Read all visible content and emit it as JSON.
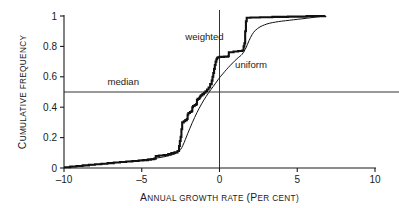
{
  "chart_data": {
    "type": "line",
    "title": "",
    "subtitle": "",
    "xlabel_lead": "A",
    "xlabel_rest": "NNUAL GROWTH RATE",
    "xlabel_paren_lead": "(P",
    "xlabel_paren_rest": "ER CENT)",
    "xlabel_full": "ANNUAL GROWTH RATE (PER CENT)",
    "ylabel_lead": "C",
    "ylabel_rest": "UMULATIVE FREQUENCY",
    "ylabel_full": "CUMULATIVE FREQUENCY",
    "xlim": [
      -10,
      10
    ],
    "ylim": [
      0,
      1
    ],
    "xticks": [
      -10,
      -5,
      0,
      5,
      10
    ],
    "xtick_labels": [
      "–10",
      "–5",
      "0",
      "5",
      "10"
    ],
    "yticks": [
      0,
      0.2,
      0.4,
      0.6,
      0.8,
      1
    ],
    "ytick_labels": [
      "0",
      "0.2",
      "0.4",
      "0.6",
      "0.8",
      "1"
    ],
    "grid": false,
    "legend_position": "inline-annotations",
    "annotations": [
      {
        "name": "median",
        "text": "median",
        "x": -7.2,
        "y": 0.545
      },
      {
        "name": "weighted",
        "text": "weighted",
        "x": -2.2,
        "y": 0.845
      },
      {
        "name": "uniform",
        "text": "uniform",
        "x": 1.0,
        "y": 0.655
      }
    ],
    "reference_lines": [
      {
        "name": "median-line",
        "orientation": "horizontal",
        "value": 0.5,
        "color": "#333333"
      },
      {
        "name": "zero-line",
        "orientation": "vertical",
        "value": 0,
        "color": "#333333"
      }
    ],
    "series": [
      {
        "name": "weighted",
        "style": "step",
        "width": 2.1,
        "color": "#111111",
        "points": [
          [
            -10.0,
            0.005
          ],
          [
            -9.6,
            0.01
          ],
          [
            -9.2,
            0.013
          ],
          [
            -8.8,
            0.017
          ],
          [
            -8.4,
            0.021
          ],
          [
            -8.0,
            0.025
          ],
          [
            -7.6,
            0.028
          ],
          [
            -7.2,
            0.032
          ],
          [
            -6.8,
            0.036
          ],
          [
            -6.4,
            0.039
          ],
          [
            -6.0,
            0.043
          ],
          [
            -5.6,
            0.046
          ],
          [
            -5.2,
            0.049
          ],
          [
            -4.9,
            0.052
          ],
          [
            -4.6,
            0.055
          ],
          [
            -4.4,
            0.058
          ],
          [
            -4.2,
            0.062
          ],
          [
            -4.1,
            0.078
          ],
          [
            -3.9,
            0.082
          ],
          [
            -3.6,
            0.086
          ],
          [
            -3.3,
            0.092
          ],
          [
            -3.1,
            0.098
          ],
          [
            -2.9,
            0.103
          ],
          [
            -2.7,
            0.112
          ],
          [
            -2.6,
            0.145
          ],
          [
            -2.55,
            0.178
          ],
          [
            -2.5,
            0.205
          ],
          [
            -2.45,
            0.255
          ],
          [
            -2.4,
            0.3
          ],
          [
            -2.3,
            0.308
          ],
          [
            -2.2,
            0.315
          ],
          [
            -2.1,
            0.322
          ],
          [
            -2.05,
            0.352
          ],
          [
            -2.0,
            0.362
          ],
          [
            -1.9,
            0.368
          ],
          [
            -1.8,
            0.374
          ],
          [
            -1.75,
            0.4
          ],
          [
            -1.7,
            0.408
          ],
          [
            -1.6,
            0.414
          ],
          [
            -1.5,
            0.42
          ],
          [
            -1.45,
            0.448
          ],
          [
            -1.4,
            0.455
          ],
          [
            -1.3,
            0.462
          ],
          [
            -1.25,
            0.47
          ],
          [
            -1.2,
            0.478
          ],
          [
            -1.1,
            0.486
          ],
          [
            -1.0,
            0.495
          ],
          [
            -0.9,
            0.505
          ],
          [
            -0.8,
            0.516
          ],
          [
            -0.7,
            0.53
          ],
          [
            -0.6,
            0.552
          ],
          [
            -0.5,
            0.575
          ],
          [
            -0.45,
            0.6
          ],
          [
            -0.4,
            0.625
          ],
          [
            -0.35,
            0.652
          ],
          [
            -0.3,
            0.678
          ],
          [
            -0.25,
            0.7
          ],
          [
            -0.2,
            0.715
          ],
          [
            -0.15,
            0.725
          ],
          [
            -0.1,
            0.729
          ],
          [
            0.0,
            0.731
          ],
          [
            0.3,
            0.733
          ],
          [
            0.55,
            0.735
          ],
          [
            0.6,
            0.762
          ],
          [
            0.9,
            0.766
          ],
          [
            1.2,
            0.77
          ],
          [
            1.45,
            0.773
          ],
          [
            1.55,
            0.8
          ],
          [
            1.6,
            0.82
          ],
          [
            1.65,
            0.9
          ],
          [
            1.7,
            0.965
          ],
          [
            1.75,
            0.988
          ],
          [
            2.0,
            0.99
          ],
          [
            2.6,
            0.992
          ],
          [
            3.4,
            0.994
          ],
          [
            4.4,
            0.996
          ],
          [
            5.6,
            0.999
          ],
          [
            6.8,
            1.0
          ]
        ]
      },
      {
        "name": "uniform",
        "style": "smooth",
        "width": 1.0,
        "color": "#111111",
        "points": [
          [
            -10.0,
            0.002
          ],
          [
            -9.4,
            0.008
          ],
          [
            -8.8,
            0.014
          ],
          [
            -8.2,
            0.02
          ],
          [
            -7.6,
            0.026
          ],
          [
            -7.0,
            0.032
          ],
          [
            -6.4,
            0.038
          ],
          [
            -5.8,
            0.044
          ],
          [
            -5.2,
            0.05
          ],
          [
            -4.8,
            0.055
          ],
          [
            -4.4,
            0.06
          ],
          [
            -4.0,
            0.066
          ],
          [
            -3.6,
            0.073
          ],
          [
            -3.2,
            0.082
          ],
          [
            -2.9,
            0.092
          ],
          [
            -2.7,
            0.104
          ],
          [
            -2.5,
            0.122
          ],
          [
            -2.35,
            0.15
          ],
          [
            -2.2,
            0.186
          ],
          [
            -2.05,
            0.225
          ],
          [
            -1.9,
            0.262
          ],
          [
            -1.75,
            0.298
          ],
          [
            -1.6,
            0.332
          ],
          [
            -1.45,
            0.364
          ],
          [
            -1.3,
            0.394
          ],
          [
            -1.15,
            0.422
          ],
          [
            -1.0,
            0.448
          ],
          [
            -0.85,
            0.472
          ],
          [
            -0.7,
            0.495
          ],
          [
            -0.55,
            0.516
          ],
          [
            -0.4,
            0.537
          ],
          [
            -0.25,
            0.558
          ],
          [
            -0.1,
            0.58
          ],
          [
            0.05,
            0.6
          ],
          [
            0.25,
            0.624
          ],
          [
            0.45,
            0.648
          ],
          [
            0.7,
            0.676
          ],
          [
            0.95,
            0.702
          ],
          [
            1.2,
            0.726
          ],
          [
            1.45,
            0.748
          ],
          [
            1.7,
            0.79
          ],
          [
            1.9,
            0.838
          ],
          [
            2.1,
            0.878
          ],
          [
            2.3,
            0.905
          ],
          [
            2.6,
            0.928
          ],
          [
            2.9,
            0.942
          ],
          [
            3.2,
            0.952
          ],
          [
            3.6,
            0.96
          ],
          [
            4.0,
            0.966
          ],
          [
            4.5,
            0.972
          ],
          [
            5.0,
            0.978
          ],
          [
            5.6,
            0.985
          ],
          [
            6.2,
            0.993
          ],
          [
            6.8,
            1.0
          ]
        ]
      }
    ]
  }
}
